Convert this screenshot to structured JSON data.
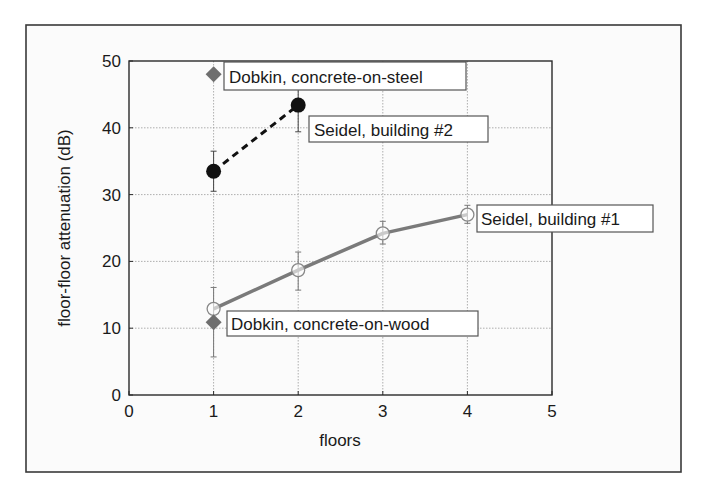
{
  "chart_data": {
    "type": "line",
    "title": "",
    "xlabel": "floors",
    "ylabel": "floor-floor attenuation (dB)",
    "xlim": [
      0,
      5
    ],
    "ylim": [
      0,
      50
    ],
    "xticks": [
      0,
      1,
      2,
      3,
      4,
      5
    ],
    "yticks": [
      0,
      10,
      20,
      30,
      40,
      50
    ],
    "xtick_labels": [
      "0",
      "1",
      "2",
      "3",
      "4",
      "5"
    ],
    "ytick_labels": [
      "0",
      "10",
      "20",
      "30",
      "40",
      "50"
    ],
    "grid": true,
    "legend": "none (direct labels)",
    "series": [
      {
        "name": "Seidel, building #1",
        "x": [
          1,
          2,
          3,
          4
        ],
        "y": [
          12.9,
          18.7,
          24.2,
          27.0
        ],
        "err_low": [
          null,
          15.7,
          22.6,
          25.7
        ],
        "err_high": [
          null,
          21.4,
          26.0,
          28.4
        ],
        "line": "solid",
        "marker": "open-circle",
        "color": "#7a7a7a"
      },
      {
        "name": "Seidel, building #2",
        "x": [
          1,
          2
        ],
        "y": [
          33.5,
          43.4
        ],
        "err_low": [
          30.5,
          39.4
        ],
        "err_high": [
          36.5,
          47.4
        ],
        "line": "dashed",
        "marker": "filled-circle",
        "color": "#111111"
      },
      {
        "name": "Dobkin, concrete-on-steel",
        "x": [
          1
        ],
        "y": [
          48.0
        ],
        "err_low": [
          null
        ],
        "err_high": [
          null
        ],
        "line": "none",
        "marker": "diamond",
        "color": "#6e6e6e"
      },
      {
        "name": "Dobkin, concrete-on-wood",
        "x": [
          1
        ],
        "y": [
          10.9
        ],
        "err_low": [
          5.7
        ],
        "err_high": [
          16.1
        ],
        "line": "none",
        "marker": "diamond",
        "color": "#6e6e6e"
      }
    ],
    "annotations": [
      {
        "text": "Dobkin, concrete-on-steel",
        "series": 2
      },
      {
        "text": "Seidel, building #2",
        "series": 1
      },
      {
        "text": "Seidel, building #1",
        "series": 0
      },
      {
        "text": "Dobkin, concrete-on-wood",
        "series": 3
      }
    ]
  }
}
